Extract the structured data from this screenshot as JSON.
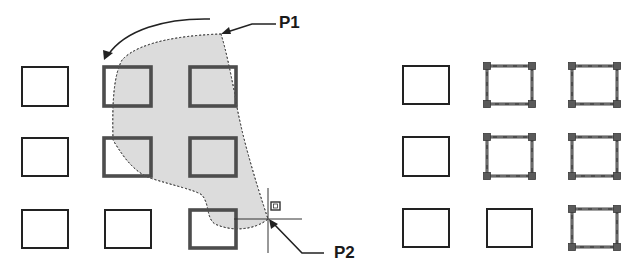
{
  "labels": {
    "p1": "P1",
    "p2": "P2"
  },
  "colors": {
    "background": "#ffffff",
    "rect_stroke": "#222222",
    "selected_stroke": "#4d4d4d",
    "grip_fill": "#5a5a5a",
    "window_fill": "#dcdcdc",
    "window_stroke": "#555555",
    "arrow": "#222222",
    "crosshair": "#333333"
  },
  "left_panel": {
    "description": "Crossing window selection in progress from P1 to P2",
    "rects": [
      {
        "row": 1,
        "col": 1,
        "x": 22,
        "y": 67,
        "w": 46,
        "h": 39,
        "state": "normal"
      },
      {
        "row": 1,
        "col": 2,
        "x": 104,
        "y": 67,
        "w": 47,
        "h": 39,
        "state": "highlighted"
      },
      {
        "row": 1,
        "col": 3,
        "x": 190,
        "y": 67,
        "w": 46,
        "h": 39,
        "state": "highlighted"
      },
      {
        "row": 2,
        "col": 1,
        "x": 22,
        "y": 138,
        "w": 46,
        "h": 38,
        "state": "normal"
      },
      {
        "row": 2,
        "col": 2,
        "x": 104,
        "y": 138,
        "w": 47,
        "h": 38,
        "state": "highlighted"
      },
      {
        "row": 2,
        "col": 3,
        "x": 190,
        "y": 138,
        "w": 46,
        "h": 38,
        "state": "highlighted"
      },
      {
        "row": 3,
        "col": 1,
        "x": 22,
        "y": 210,
        "w": 46,
        "h": 38,
        "state": "normal"
      },
      {
        "row": 3,
        "col": 2,
        "x": 105,
        "y": 210,
        "w": 46,
        "h": 38,
        "state": "normal"
      },
      {
        "row": 3,
        "col": 3,
        "x": 190,
        "y": 210,
        "w": 46,
        "h": 38,
        "state": "highlighted"
      }
    ],
    "lasso_path": "M221,34 C190,35 140,40 122,60 C114,75 112,100 113,140 C125,160 135,172 150,178 C175,186 195,190 202,195 C210,205 206,218 215,224 C232,232 255,230 268,219 C255,180 240,130 235,95 C230,70 226,50 221,34 Z",
    "curved_arrow": {
      "path": "M210,19 C165,18 125,30 108,55",
      "head": "104,60 103,50 113,53"
    },
    "p1_leader": {
      "points": "276,24 252,24 224,33",
      "head": "221,34 229,27 231,34"
    },
    "p2_leader": {
      "points": "324,253 302,253 272,222",
      "head": "269,219 271,229 278,224"
    },
    "crosshair": {
      "cx": 268,
      "cy": 219,
      "v_top": 188,
      "v_bottom": 253,
      "h_left": 234,
      "h_right": 302
    },
    "cursor_badge": {
      "x": 271,
      "y": 202,
      "w": 9,
      "h": 8
    }
  },
  "right_panel": {
    "description": "Objects selected showing grips",
    "rects": [
      {
        "row": 1,
        "col": 1,
        "x": 403,
        "y": 66,
        "w": 46,
        "h": 38,
        "state": "normal"
      },
      {
        "row": 1,
        "col": 2,
        "x": 487,
        "y": 66,
        "w": 45,
        "h": 38,
        "state": "selected"
      },
      {
        "row": 1,
        "col": 3,
        "x": 572,
        "y": 66,
        "w": 45,
        "h": 38,
        "state": "selected"
      },
      {
        "row": 2,
        "col": 1,
        "x": 403,
        "y": 137,
        "w": 46,
        "h": 39,
        "state": "normal"
      },
      {
        "row": 2,
        "col": 2,
        "x": 487,
        "y": 137,
        "w": 45,
        "h": 39,
        "state": "selected"
      },
      {
        "row": 2,
        "col": 3,
        "x": 572,
        "y": 137,
        "w": 45,
        "h": 39,
        "state": "selected"
      },
      {
        "row": 3,
        "col": 1,
        "x": 403,
        "y": 209,
        "w": 46,
        "h": 38,
        "state": "normal"
      },
      {
        "row": 3,
        "col": 2,
        "x": 487,
        "y": 209,
        "w": 45,
        "h": 38,
        "state": "normal"
      },
      {
        "row": 3,
        "col": 3,
        "x": 572,
        "y": 209,
        "w": 45,
        "h": 38,
        "state": "selected"
      }
    ]
  }
}
